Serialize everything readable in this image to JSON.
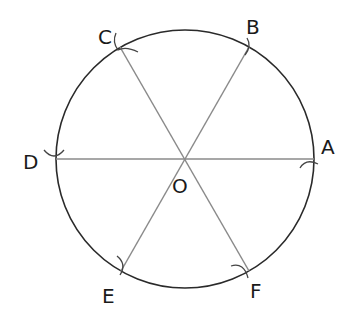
{
  "diagram": {
    "type": "circle-hexagon-construction",
    "center": {
      "label": "O",
      "x": 185,
      "y": 159
    },
    "radius": 129,
    "circle_color": "#2a2a2a",
    "line_color": "#8a8a8a",
    "points": [
      {
        "label": "A",
        "x": 314,
        "y": 159
      },
      {
        "label": "B",
        "x": 249,
        "y": 47
      },
      {
        "label": "C",
        "x": 120,
        "y": 47
      },
      {
        "label": "D",
        "x": 56,
        "y": 159
      },
      {
        "label": "E",
        "x": 121,
        "y": 271
      },
      {
        "label": "F",
        "x": 249,
        "y": 271
      }
    ],
    "segments": [
      "AD",
      "BE",
      "CF"
    ]
  }
}
